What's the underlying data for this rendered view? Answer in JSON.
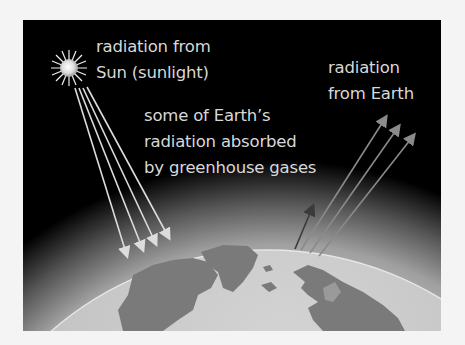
{
  "diagram": {
    "labels": {
      "sun_radiation": [
        "radiation from",
        "Sun (sunlight)"
      ],
      "absorbed": [
        "some of Earth’s",
        "radiation absorbed",
        "by greenhouse gases"
      ],
      "earth_radiation": [
        "radiation",
        "from Earth"
      ]
    },
    "elements": {
      "sun": "sun-icon",
      "earth": "earth-globe",
      "atmosphere": "atmosphere-glow",
      "incoming_rays": 4,
      "outgoing_rays": 3,
      "absorbed_rays": 1
    },
    "colors": {
      "background": "#000000",
      "text": "#d8d8d8",
      "ocean": "#c8c8c8",
      "land": "#7a7a7a",
      "atmosphere": "#9a9a9a",
      "incoming_ray": "#dcdcdc",
      "outgoing_ray": "#8a8a8a",
      "absorbed_ray": "#3a3a3a"
    }
  }
}
